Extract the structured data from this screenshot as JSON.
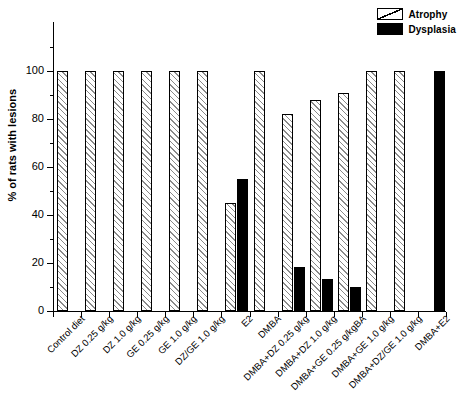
{
  "chart_data": {
    "type": "bar",
    "title": "",
    "xlabel": "",
    "ylabel": "% of rats with lesions",
    "ylim": [
      0,
      100
    ],
    "yticks": [
      0,
      20,
      40,
      60,
      80,
      100
    ],
    "yticks_minor": [
      10,
      30,
      50,
      70,
      90,
      110
    ],
    "grid": false,
    "legend_position": "top-right",
    "categories": [
      "Control diet",
      "DZ 0.25 g/kg",
      "DZ 1.0 g/kg",
      "GE 0.25 g/kg",
      "GE 1.0 g/kg",
      "DZ/GE 1.0 g/kg",
      "E2",
      "DMBA",
      "DMBA+DZ 0.25 g/kg",
      "DMBA+DZ 1.0 g/kg",
      "DMBA+GE 0.25 g/kgBA",
      "DMBA+GE 1.0 g/kg",
      "DMBA+DZ/GE 1.0 g/kg",
      "DMBA+E2"
    ],
    "series": [
      {
        "name": "Atrophy",
        "color": "#ffffff",
        "pattern": "hatched",
        "values": [
          100,
          100,
          100,
          100,
          100,
          100,
          45,
          100,
          82,
          88,
          91,
          100,
          100,
          0
        ]
      },
      {
        "name": "Dysplasia",
        "color": "#000000",
        "pattern": "solid",
        "values": [
          0,
          0,
          0,
          0,
          0,
          0,
          55,
          0,
          18.5,
          13.5,
          10,
          0,
          0,
          100
        ]
      }
    ]
  },
  "legend": {
    "items": [
      {
        "label": "Atrophy"
      },
      {
        "label": "Dysplasia"
      }
    ]
  }
}
